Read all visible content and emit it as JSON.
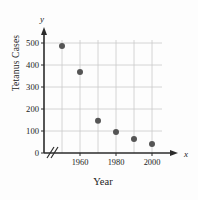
{
  "chart_data": {
    "type": "scatter",
    "title": "",
    "xlabel": "Year",
    "ylabel": "Tetanus Cases",
    "x_axis_variable": "x",
    "y_axis_variable": "y",
    "x": [
      1950,
      1960,
      1970,
      1980,
      1990,
      2000
    ],
    "values": [
      486,
      368,
      147,
      95,
      64,
      41
    ],
    "series": [
      {
        "name": "Tetanus Cases",
        "points": [
          {
            "x": 1950,
            "y": 486
          },
          {
            "x": 1960,
            "y": 368
          },
          {
            "x": 1970,
            "y": 147
          },
          {
            "x": 1980,
            "y": 95
          },
          {
            "x": 1990,
            "y": 64
          },
          {
            "x": 2000,
            "y": 41
          }
        ]
      }
    ],
    "xlim": [
      1945,
      2005
    ],
    "ylim": [
      0,
      550
    ],
    "x_tick_labels": [
      "1960",
      "1980",
      "2000"
    ],
    "x_tick_values": [
      1960,
      1980,
      2000
    ],
    "x_gridline_values": [
      1950,
      1960,
      1970,
      1980,
      1990,
      2000
    ],
    "y_tick_labels": [
      "0",
      "100",
      "200",
      "300",
      "400",
      "500"
    ],
    "y_tick_values": [
      0,
      100,
      200,
      300,
      400,
      500
    ],
    "grid": true,
    "legend": "none",
    "axis_break_x": true,
    "marker_color": "#555555",
    "grid_color": "#c9c9c9",
    "axis_color": "#2b2b2b",
    "background_color": "#fdfdfd"
  }
}
